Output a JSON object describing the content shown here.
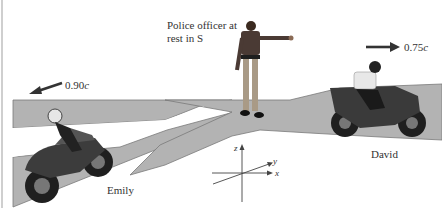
{
  "figure": {
    "officer_label_line1": "Police officer at",
    "officer_label_line2": "rest in S",
    "emily": {
      "name": "Emily",
      "speed": "0.90",
      "unit": "c",
      "direction": "left"
    },
    "david": {
      "name": "David",
      "speed": "0.75",
      "unit": "c",
      "direction": "right"
    },
    "axes": {
      "z": "z",
      "y": "y",
      "x": "x"
    },
    "colors": {
      "road": "#b3b3b3",
      "road_edge": "#6e6e6e",
      "arrow": "#333333",
      "background": "#ffffff"
    }
  }
}
